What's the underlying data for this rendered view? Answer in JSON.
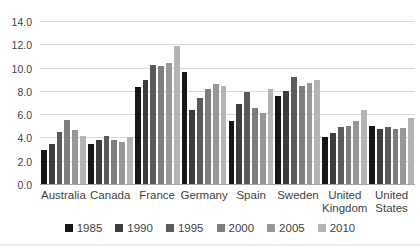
{
  "figure": {
    "background": "#ffffff",
    "gridline_color": "#d9d9d9",
    "axis_line_color": "#a6a6a6",
    "tick_label_color": "#3f3f3f"
  },
  "chart_data": {
    "type": "bar",
    "title": "",
    "xlabel": "",
    "ylabel": "",
    "ylim": [
      0,
      14
    ],
    "ytick_step": 2,
    "yticks": [
      "0.0",
      "2.0",
      "4.0",
      "6.0",
      "8.0",
      "10.0",
      "12.0",
      "14.0"
    ],
    "grid": "horizontal",
    "legend_position": "bottom",
    "categories": [
      "Australia",
      "Canada",
      "France",
      "Germany",
      "Spain",
      "Sweden",
      "United Kingdom",
      "United States"
    ],
    "series": [
      {
        "name": "1985",
        "color": "#161616",
        "values": [
          2.9,
          3.4,
          8.3,
          9.6,
          5.4,
          7.6,
          4.0,
          5.0
        ]
      },
      {
        "name": "1990",
        "color": "#3d3d3d",
        "values": [
          3.4,
          3.8,
          8.9,
          6.4,
          6.9,
          8.0,
          4.4,
          4.7
        ]
      },
      {
        "name": "1995",
        "color": "#5a5a5a",
        "values": [
          4.5,
          4.1,
          10.2,
          7.4,
          7.9,
          9.2,
          4.9,
          4.9
        ]
      },
      {
        "name": "2000",
        "color": "#7e7e7e",
        "values": [
          5.5,
          3.8,
          10.1,
          8.2,
          6.5,
          8.4,
          5.0,
          4.7
        ]
      },
      {
        "name": "2005",
        "color": "#979797",
        "values": [
          4.6,
          3.6,
          10.4,
          8.6,
          6.1,
          8.7,
          5.4,
          4.8
        ]
      },
      {
        "name": "2010",
        "color": "#b4b4b4",
        "values": [
          4.1,
          4.0,
          11.9,
          8.4,
          8.2,
          8.9,
          6.4,
          5.7
        ]
      }
    ]
  }
}
